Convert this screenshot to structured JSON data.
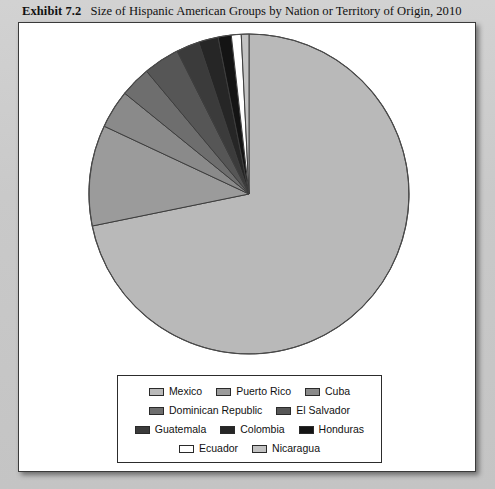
{
  "caption": {
    "exhibit_number": "Exhibit 7.2",
    "title": "Size of Hispanic American Groups by Nation or Territory of Origin, 2010"
  },
  "chart_data": {
    "type": "pie",
    "title": "Size of Hispanic American Groups by Nation or Territory of Origin, 2010",
    "subtitle": "",
    "xlabel": "",
    "ylabel": "",
    "legend_position": "bottom",
    "grid": false,
    "start_angle_deg": 0,
    "direction": "clockwise",
    "categories": [
      "Mexico",
      "Puerto Rico",
      "Cuba",
      "Dominican Republic",
      "El Salvador",
      "Guatemala",
      "Colombia",
      "Honduras",
      "Ecuador",
      "Nicaragua"
    ],
    "values": [
      64.9,
      9.2,
      3.5,
      2.8,
      3.3,
      2.1,
      1.8,
      1.2,
      0.9,
      0.7
    ],
    "colors": [
      "#b9b9b9",
      "#9b9b9b",
      "#8a8a8a",
      "#6e6e6e",
      "#565656",
      "#3b3b3b",
      "#262626",
      "#141414",
      "#ffffff",
      "#c2c2c2"
    ]
  },
  "legend": {
    "rows": [
      [
        {
          "label": "Mexico",
          "color": "#b9b9b9"
        },
        {
          "label": "Puerto Rico",
          "color": "#9b9b9b"
        },
        {
          "label": "Cuba",
          "color": "#8a8a8a"
        }
      ],
      [
        {
          "label": "Dominican Republic",
          "color": "#6e6e6e"
        },
        {
          "label": "El Salvador",
          "color": "#565656"
        }
      ],
      [
        {
          "label": "Guatemala",
          "color": "#3b3b3b"
        },
        {
          "label": "Colombia",
          "color": "#262626"
        },
        {
          "label": "Honduras",
          "color": "#141414"
        }
      ],
      [
        {
          "label": "Ecuador",
          "color": "#ffffff"
        },
        {
          "label": "Nicaragua",
          "color": "#c2c2c2"
        }
      ]
    ]
  }
}
